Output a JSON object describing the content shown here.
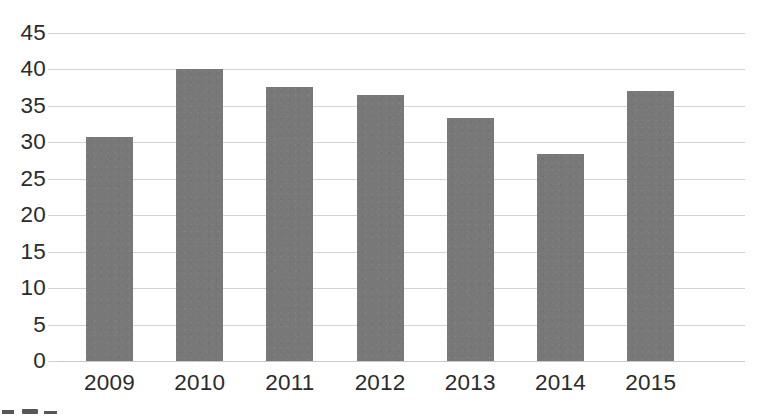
{
  "chart_data": {
    "type": "bar",
    "title": "",
    "subtitle": "",
    "xlabel": "",
    "ylabel": "",
    "categories": [
      "2009",
      "2010",
      "2011",
      "2012",
      "2013",
      "2014",
      "2015"
    ],
    "values": [
      30.8,
      40.0,
      37.6,
      36.5,
      33.4,
      28.4,
      37.1
    ],
    "series": [
      {
        "name": "",
        "values": [
          30.8,
          40.0,
          37.6,
          36.5,
          33.4,
          28.4,
          37.1
        ],
        "color": "#787878"
      }
    ],
    "ylim": [
      0,
      45
    ],
    "y_tick_step": 5,
    "y_ticks": [
      "0",
      "5",
      "10",
      "15",
      "20",
      "25",
      "30",
      "35",
      "40",
      "45"
    ],
    "y_tick_values": [
      0,
      5,
      10,
      15,
      20,
      25,
      30,
      35,
      40,
      45
    ],
    "grid": "horizontal",
    "legend": "none",
    "annotations": [],
    "colors": {
      "bar_fill": "#787878",
      "gridline": "#d3d3d3",
      "baseline": "#c8c8c8",
      "tick_label": "#2b2b2b",
      "background": "#ffffff"
    }
  }
}
